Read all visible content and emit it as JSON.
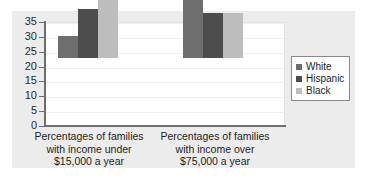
{
  "chart_data": {
    "type": "bar",
    "title": "",
    "subtitle": "",
    "xlabel": "",
    "ylabel": "",
    "ylim": [
      0,
      35
    ],
    "yticks": [
      0,
      5,
      10,
      15,
      20,
      25,
      30,
      35
    ],
    "ytick_labels": [
      "0",
      "5",
      "10",
      "15",
      "20",
      "25",
      "30",
      "35"
    ],
    "grid": true,
    "grid_axis": "y",
    "legend_position": "right",
    "categories": [
      "Percentages of families\nwith income under\n$15,000 a year",
      "Percentages of families\nwith income over\n$75,000 a year"
    ],
    "series": [
      {
        "name": "White",
        "values": [
          7.5,
          32.2
        ],
        "color": "#6e6e6e"
      },
      {
        "name": "Hispanic",
        "values": [
          16.5,
          15.2
        ],
        "color": "#4d4d4d"
      },
      {
        "name": "Black",
        "values": [
          20.5,
          15.2
        ],
        "color": "#bdbdbd"
      }
    ]
  },
  "legend": {
    "entries": [
      {
        "label": "White",
        "color": "#6e6e6e"
      },
      {
        "label": "Hispanic",
        "color": "#4d4d4d"
      },
      {
        "label": "Black",
        "color": "#bdbdbd"
      }
    ]
  },
  "colors": {
    "figure_background": "#ffffff",
    "panel_background": "#ececec",
    "plot_background": "#ffffff",
    "axis": "#6e6e6e",
    "gridline": "#efefef",
    "text": "#1d1d1d",
    "legend_border": "#8a8a8a"
  }
}
